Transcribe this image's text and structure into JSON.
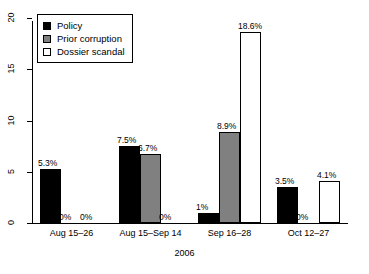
{
  "chart_data": {
    "type": "bar",
    "title": "",
    "xlabel": "2006",
    "ylabel": "",
    "ylim": [
      0,
      20
    ],
    "yticks": [
      "0",
      "5",
      "10",
      "15",
      "20"
    ],
    "grid": false,
    "legend_position": "top-left",
    "categories": [
      "Aug 15–26",
      "Aug 15–Sep 14",
      "Sep 16–28",
      "Oct 12–27"
    ],
    "series": [
      {
        "name": "Policy",
        "color": "#000000",
        "values": [
          5.3,
          7.5,
          1.0,
          3.5
        ],
        "labels": [
          "5.3%",
          "7.5%",
          "1%",
          "3.5%"
        ]
      },
      {
        "name": "Prior corruption",
        "color": "#808080",
        "values": [
          0,
          6.7,
          8.9,
          0
        ],
        "labels": [
          "0%",
          "6.7%",
          "8.9%",
          "0%"
        ]
      },
      {
        "name": "Dossier scandal",
        "color": "#ffffff",
        "values": [
          0,
          0,
          18.6,
          4.1
        ],
        "labels": [
          "0%",
          "0%",
          "18.6%",
          "4.1%"
        ]
      }
    ]
  },
  "legend": {
    "items": [
      {
        "label": "Policy",
        "swatch": "policy"
      },
      {
        "label": "Prior corruption",
        "swatch": "prior"
      },
      {
        "label": "Dossier scandal",
        "swatch": "dossier"
      }
    ]
  }
}
